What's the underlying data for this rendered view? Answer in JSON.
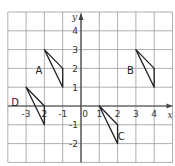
{
  "diagram": {
    "type": "coordinate-grid",
    "x_axis_label": "x",
    "y_axis_label": "y",
    "x_range": [
      -4,
      5
    ],
    "y_range": [
      -3,
      5
    ],
    "x_tick_labels": [
      {
        "value": -3,
        "text": "-3"
      },
      {
        "value": -2,
        "text": "2"
      },
      {
        "value": -1,
        "text": "-1"
      },
      {
        "value": 0,
        "text": "0"
      },
      {
        "value": 1,
        "text": "1"
      },
      {
        "value": 2,
        "text": "2"
      },
      {
        "value": 3,
        "text": "3"
      },
      {
        "value": 4,
        "text": "4"
      }
    ],
    "y_tick_labels": [
      {
        "value": 4,
        "text": "4"
      },
      {
        "value": 3,
        "text": "3"
      },
      {
        "value": 2,
        "text": "2"
      },
      {
        "value": 1,
        "text": "1"
      },
      {
        "value": -1,
        "text": "-1"
      },
      {
        "value": -2,
        "text": "-2"
      }
    ],
    "shapes": [
      {
        "label": "A",
        "vertices": [
          [
            -2,
            3
          ],
          [
            -1,
            2
          ],
          [
            -1,
            1
          ]
        ],
        "label_pos": [
          -2.3,
          1.9
        ]
      },
      {
        "label": "B",
        "vertices": [
          [
            3,
            3
          ],
          [
            4,
            2
          ],
          [
            4,
            1
          ]
        ],
        "label_pos": [
          2.7,
          1.9
        ]
      },
      {
        "label": "C",
        "vertices": [
          [
            1,
            0
          ],
          [
            2,
            -1
          ],
          [
            2,
            -2
          ]
        ],
        "label_pos": [
          2.2,
          -1.6
        ]
      },
      {
        "label": "D",
        "vertices": [
          [
            -3,
            1
          ],
          [
            -2,
            0
          ],
          [
            -2,
            -1
          ]
        ],
        "label_pos": [
          -3.6,
          0.2
        ]
      }
    ],
    "colors": {
      "grid": "#9a9a9a",
      "axis": "#444444",
      "shape": "#222222"
    }
  }
}
